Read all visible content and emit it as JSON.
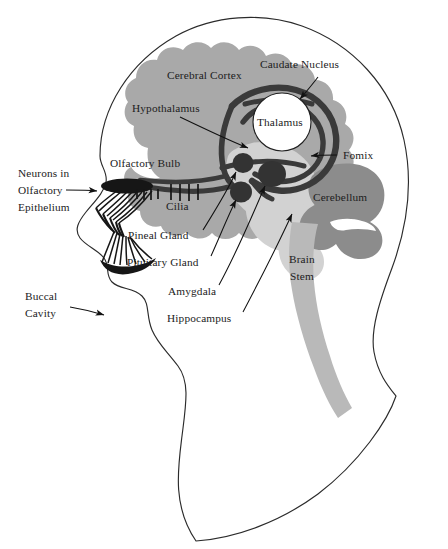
{
  "figure": {
    "title": "",
    "caption": ""
  },
  "palette": {
    "background": "#ffffff",
    "outline": "#2b2b2b",
    "cerebral_cortex": "#a9a9a9",
    "cerebellum": "#8c8c8c",
    "limbic_light": "#d2d2d2",
    "brain_stem": "#b9b9b9",
    "dark_structure": "#3a3a3a",
    "nucleus_dark": "#333333",
    "text": "#1c1c1c",
    "thalamus_fill": "#ffffff"
  },
  "labels": {
    "cerebral_cortex": "Cerebral Cortex",
    "caudate_nucleus": "Caudate Nucleus",
    "hypothalamus": "Hypothalamus",
    "thalamus": "Thalamus",
    "fornix": "Fomix",
    "cerebellum": "Cerebellum",
    "olfactory_bulb": "Olfactory Bulb",
    "cilia": "Cilia",
    "pineal_gland": "Pineal Gland",
    "pituitary_gland": "Pituitary Gland",
    "amygdala": "Amygdala",
    "hippocampus": "Hippocampus",
    "brain_stem_line1": "Brain",
    "brain_stem_line2": "Stem",
    "neurons_line1": "Neurons in",
    "neurons_line2": "Olfactory",
    "neurons_line3": "Epithelium",
    "buccal_line1": "Buccal",
    "buccal_line2": "Cavity"
  },
  "structures": [
    {
      "name": "cerebral-cortex",
      "label": "Cerebral Cortex",
      "color": "#a9a9a9",
      "has_leader": false
    },
    {
      "name": "caudate-nucleus",
      "label": "Caudate Nucleus",
      "color": "#3a3a3a",
      "has_leader": true
    },
    {
      "name": "hypothalamus",
      "label": "Hypothalamus",
      "color": "#3a3a3a",
      "has_leader": true
    },
    {
      "name": "thalamus",
      "label": "Thalamus",
      "color": "#ffffff",
      "has_leader": false
    },
    {
      "name": "fornix",
      "label": "Fomix",
      "color": "#3a3a3a",
      "has_leader": true
    },
    {
      "name": "cerebellum",
      "label": "Cerebellum",
      "color": "#8c8c8c",
      "has_leader": false
    },
    {
      "name": "olfactory-bulb",
      "label": "Olfactory Bulb",
      "color": "#161616",
      "has_leader": false
    },
    {
      "name": "cilia",
      "label": "Cilia",
      "color": "#161616",
      "has_leader": false
    },
    {
      "name": "pineal-gland",
      "label": "Pineal Gland",
      "color": "#333333",
      "has_leader": true
    },
    {
      "name": "pituitary-gland",
      "label": "Pituitary Gland",
      "color": "#333333",
      "has_leader": true
    },
    {
      "name": "amygdala",
      "label": "Amygdala",
      "color": "#333333",
      "has_leader": true
    },
    {
      "name": "hippocampus",
      "label": "Hippocampus",
      "color": "#d2d2d2",
      "has_leader": true
    },
    {
      "name": "brain-stem",
      "label": "Brain Stem",
      "color": "#b9b9b9",
      "has_leader": false
    },
    {
      "name": "neurons-olfactory-epithelium",
      "label": "Neurons in Olfactory Epithelium",
      "color": "#161616",
      "has_leader": true
    },
    {
      "name": "buccal-cavity",
      "label": "Buccal Cavity",
      "color": "#ffffff",
      "has_leader": true
    }
  ]
}
